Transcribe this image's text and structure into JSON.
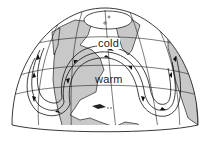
{
  "diagram": {
    "type": "hemisphere-globe",
    "labels": {
      "cold": "cold",
      "warm": "warm"
    },
    "colors": {
      "land": "#c8c8c8",
      "ocean": "#ffffff",
      "lines": "#222222"
    },
    "flow": {
      "direction": "west-to-east",
      "pattern": "wave with northward crest over North America and southward troughs on west and east sides"
    }
  }
}
